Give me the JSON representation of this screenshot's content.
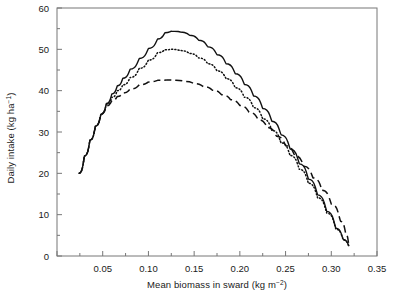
{
  "chart_data": {
    "type": "line",
    "title": "",
    "xlabel": "Mean biomass in sward (kg m",
    "xlabel_sup": "−2",
    "xlabel_tail": ")",
    "ylabel": "Daily intake (kg ha",
    "ylabel_sup": "−1",
    "ylabel_tail": ")",
    "xlim": [
      0.0,
      0.35
    ],
    "ylim": [
      0,
      60
    ],
    "xticks": [
      0.0,
      0.05,
      0.1,
      0.15,
      0.2,
      0.25,
      0.3,
      0.35
    ],
    "xticklabels": [
      "",
      "0.05",
      "0.10",
      "0.15",
      "0.20",
      "0.25",
      "0.30",
      "0.35"
    ],
    "yticks": [
      0,
      10,
      20,
      30,
      40,
      50,
      60
    ],
    "yticklabels": [
      "0",
      "10",
      "20",
      "30",
      "40",
      "50",
      "60"
    ],
    "x_minor_ticks": [
      0.025,
      0.075,
      0.125,
      0.175,
      0.225,
      0.275,
      0.325
    ],
    "y_minor_ticks": [
      5,
      15,
      25,
      35,
      45,
      55
    ],
    "grid": false,
    "legend": "none",
    "axis_color": "#777777",
    "line_color": "#111111",
    "series": [
      {
        "name": "solid",
        "style": "solid",
        "x": [
          0.024,
          0.03,
          0.036,
          0.042,
          0.048,
          0.054,
          0.06,
          0.066,
          0.072,
          0.08,
          0.09,
          0.1,
          0.11,
          0.118,
          0.125,
          0.135,
          0.145,
          0.155,
          0.165,
          0.175,
          0.185,
          0.195,
          0.205,
          0.215,
          0.225,
          0.235,
          0.245,
          0.255,
          0.265,
          0.275,
          0.285,
          0.295,
          0.305,
          0.313,
          0.319
        ],
        "y": [
          20.0,
          24.2,
          28.0,
          31.4,
          34.3,
          36.9,
          39.2,
          41.2,
          43.0,
          45.2,
          47.8,
          50.2,
          52.5,
          54.0,
          54.4,
          54.2,
          53.4,
          52.2,
          50.6,
          48.7,
          46.5,
          44.1,
          41.5,
          38.7,
          35.7,
          32.6,
          29.3,
          25.9,
          22.3,
          18.6,
          14.8,
          10.8,
          6.7,
          4.0,
          2.5
        ]
      },
      {
        "name": "dotted",
        "style": "dotted",
        "x": [
          0.024,
          0.03,
          0.036,
          0.042,
          0.048,
          0.054,
          0.06,
          0.066,
          0.072,
          0.08,
          0.09,
          0.1,
          0.11,
          0.118,
          0.125,
          0.135,
          0.145,
          0.155,
          0.165,
          0.175,
          0.185,
          0.195,
          0.205,
          0.215,
          0.225,
          0.235,
          0.245,
          0.255,
          0.265,
          0.275,
          0.285,
          0.295,
          0.305,
          0.313,
          0.319
        ],
        "y": [
          20.0,
          24.2,
          28.0,
          31.4,
          34.3,
          36.6,
          38.4,
          40.0,
          41.4,
          43.2,
          45.4,
          47.4,
          49.2,
          49.9,
          50.0,
          49.7,
          49.0,
          47.9,
          46.5,
          44.8,
          42.9,
          40.7,
          38.4,
          35.9,
          33.2,
          30.4,
          27.4,
          24.3,
          21.0,
          17.6,
          14.1,
          10.4,
          6.5,
          3.9,
          2.5
        ]
      },
      {
        "name": "dashed",
        "style": "dashed",
        "x": [
          0.024,
          0.03,
          0.036,
          0.042,
          0.048,
          0.054,
          0.06,
          0.066,
          0.072,
          0.08,
          0.09,
          0.1,
          0.11,
          0.12,
          0.13,
          0.14,
          0.15,
          0.16,
          0.17,
          0.18,
          0.19,
          0.2,
          0.21,
          0.22,
          0.23,
          0.24,
          0.25,
          0.26,
          0.27,
          0.28,
          0.29,
          0.3,
          0.31,
          0.316,
          0.319
        ],
        "y": [
          20.0,
          24.2,
          28.0,
          31.4,
          34.3,
          36.3,
          37.6,
          38.6,
          39.4,
          40.4,
          41.4,
          42.1,
          42.5,
          42.6,
          42.5,
          42.2,
          41.7,
          41.0,
          40.1,
          39.0,
          37.8,
          36.4,
          34.8,
          33.0,
          31.1,
          29.0,
          26.7,
          24.3,
          21.7,
          18.9,
          15.9,
          12.6,
          8.4,
          5.2,
          2.9
        ]
      }
    ]
  }
}
